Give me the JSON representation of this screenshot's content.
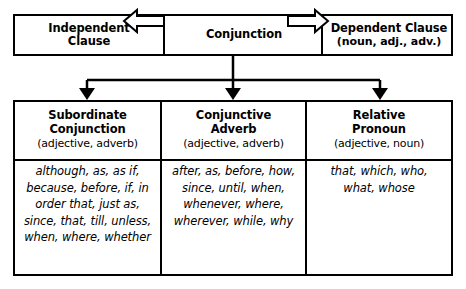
{
  "diagram": {
    "top_row": {
      "left": {
        "line1": "Independent",
        "line2": "Clause"
      },
      "center": {
        "label": "Conjunction"
      },
      "right": {
        "line1": "Dependent Clause",
        "line2": "(noun, adj., adv.)"
      },
      "arrow_left": "arrow-left-icon",
      "arrow_right": "arrow-right-icon"
    },
    "columns": [
      {
        "title_line1": "Subordinate",
        "title_line2": "Conjunction",
        "subtitle": "(adjective, adverb)",
        "words": "although, as, as if, because, before, if, in order that, just as, since, that, till, unless, when, where, whether"
      },
      {
        "title_line1": "Conjunctive",
        "title_line2": "Adverb",
        "subtitle": "(adjective, adverb)",
        "words": "after, as, before, how, since, until, when, whenever, where, wherever, while, why"
      },
      {
        "title_line1": "Relative",
        "title_line2": "Pronoun",
        "subtitle": "(adjective, noun)",
        "words": "that, which, who, what, whose"
      }
    ],
    "colors": {
      "stroke": "#000000",
      "background": "#ffffff"
    }
  }
}
